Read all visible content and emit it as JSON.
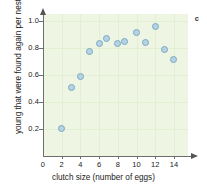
{
  "chart_data": {
    "type": "scatter",
    "title": "",
    "panel_label": "c",
    "xlabel": "clutch size (number of eggs)",
    "ylabel": "young that were found again per nest",
    "xlim": [
      0,
      15.5
    ],
    "ylim": [
      0,
      1.05
    ],
    "xticks": [
      0,
      2,
      4,
      6,
      8,
      10,
      12,
      14
    ],
    "xtick_labels": [
      "0",
      "2",
      "4",
      "6",
      "8",
      "10",
      "12",
      "14"
    ],
    "yticks": [
      0.2,
      0.4,
      0.6,
      0.8,
      1.0
    ],
    "ytick_labels": [
      "0.2",
      "0.4",
      "0.6",
      "0.8",
      "1.0"
    ],
    "grid": true,
    "legend": "none",
    "marker_color": "#b6d3e4",
    "marker_edge_color": "#7ba8c4",
    "panel_background": "#eef6e3",
    "points": [
      {
        "x": 2.0,
        "y": 0.2
      },
      {
        "x": 3.0,
        "y": 0.51
      },
      {
        "x": 4.0,
        "y": 0.59
      },
      {
        "x": 5.0,
        "y": 0.77
      },
      {
        "x": 6.0,
        "y": 0.83
      },
      {
        "x": 6.8,
        "y": 0.87
      },
      {
        "x": 8.0,
        "y": 0.83
      },
      {
        "x": 8.7,
        "y": 0.85
      },
      {
        "x": 10.0,
        "y": 0.91
      },
      {
        "x": 11.0,
        "y": 0.84
      },
      {
        "x": 12.0,
        "y": 0.96
      },
      {
        "x": 13.0,
        "y": 0.79
      },
      {
        "x": 14.0,
        "y": 0.71
      }
    ]
  }
}
